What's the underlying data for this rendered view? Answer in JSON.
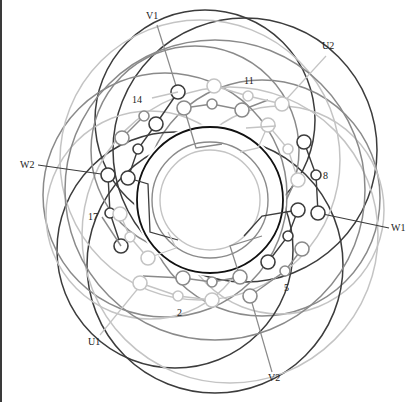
{
  "diagram": {
    "title": "",
    "type": "stator winding diagram (three-phase, 18 slots)",
    "center": [
      210,
      200
    ],
    "colors": {
      "phase_dark": "#3c3c3c",
      "phase_mid": "#8a8a8a",
      "phase_light": "#c4c4c4",
      "core": "#111111",
      "label": "#222222"
    },
    "terminal_labels": [
      {
        "text": "V1",
        "x": 146,
        "y": 19
      },
      {
        "text": "U2",
        "x": 322,
        "y": 49
      },
      {
        "text": "W2",
        "x": 20,
        "y": 168
      },
      {
        "text": "W1",
        "x": 391,
        "y": 231
      },
      {
        "text": "U1",
        "x": 88,
        "y": 345
      },
      {
        "text": "V2",
        "x": 268,
        "y": 381
      }
    ],
    "slot_labels": [
      {
        "text": "14",
        "x": 132,
        "y": 103
      },
      {
        "text": "11",
        "x": 244,
        "y": 84
      },
      {
        "text": "8",
        "x": 323,
        "y": 179
      },
      {
        "text": "17",
        "x": 88,
        "y": 220
      },
      {
        "text": "5",
        "x": 284,
        "y": 291
      },
      {
        "text": "2",
        "x": 177,
        "y": 316
      }
    ],
    "leaders": [
      {
        "from": [
          157,
          25
        ],
        "to": [
          178,
          92
        ],
        "color": "mid"
      },
      {
        "from": [
          326,
          56
        ],
        "to": [
          282,
          104
        ],
        "color": "light"
      },
      {
        "from": [
          38,
          165
        ],
        "to": [
          108,
          175
        ],
        "color": "dark"
      },
      {
        "from": [
          389,
          228
        ],
        "to": [
          318,
          213
        ],
        "color": "dark"
      },
      {
        "from": [
          100,
          335
        ],
        "to": [
          140,
          286
        ],
        "color": "light"
      },
      {
        "from": [
          272,
          372
        ],
        "to": [
          250,
          296
        ],
        "color": "mid"
      }
    ],
    "outer_arcs": [
      {
        "cx": 245,
        "cy": 150,
        "r": 132,
        "color": "dark"
      },
      {
        "cx": 205,
        "cy": 120,
        "r": 110,
        "color": "dark"
      },
      {
        "cx": 262,
        "cy": 198,
        "r": 118,
        "color": "mid"
      },
      {
        "cx": 280,
        "cy": 210,
        "r": 104,
        "color": "light"
      },
      {
        "cx": 175,
        "cy": 250,
        "r": 118,
        "color": "dark"
      },
      {
        "cx": 215,
        "cy": 265,
        "r": 128,
        "color": "dark"
      },
      {
        "cx": 165,
        "cy": 195,
        "r": 122,
        "color": "mid"
      },
      {
        "cx": 200,
        "cy": 160,
        "r": 140,
        "color": "light"
      },
      {
        "cx": 150,
        "cy": 215,
        "r": 104,
        "color": "light"
      },
      {
        "cx": 230,
        "cy": 235,
        "r": 148,
        "color": "light"
      },
      {
        "cx": 215,
        "cy": 190,
        "r": 150,
        "color": "mid"
      },
      {
        "cx": 195,
        "cy": 150,
        "r": 104,
        "color": "mid"
      }
    ],
    "inner_rings": [
      {
        "r": 73,
        "color": "core",
        "width": 1.8
      },
      {
        "r": 58,
        "color": "mid",
        "width": 1.4
      },
      {
        "r": 50,
        "color": "light",
        "width": 1.4
      }
    ],
    "chains": [
      {
        "color": "dark",
        "points": [
          [
            178,
            92
          ],
          [
            156,
            124
          ],
          [
            138,
            149
          ],
          [
            128,
            178
          ]
        ],
        "sizes": [
          7,
          7,
          5,
          7
        ]
      },
      {
        "color": "dark",
        "points": [
          [
            108,
            175
          ],
          [
            110,
            213
          ],
          [
            121,
            246
          ]
        ],
        "sizes": [
          7,
          5,
          7
        ]
      },
      {
        "color": "dark",
        "points": [
          [
            304,
            142
          ],
          [
            316,
            175
          ],
          [
            318,
            213
          ]
        ],
        "sizes": [
          7,
          5,
          7
        ]
      },
      {
        "color": "dark",
        "points": [
          [
            298,
            210
          ],
          [
            288,
            236
          ],
          [
            268,
            262
          ]
        ],
        "sizes": [
          7,
          5,
          7
        ]
      },
      {
        "color": "mid",
        "points": [
          [
            184,
            108
          ],
          [
            212,
            104
          ],
          [
            242,
            110
          ],
          [
            268,
            100
          ]
        ],
        "sizes": [
          7,
          5,
          7,
          0
        ]
      },
      {
        "color": "mid",
        "points": [
          [
            124,
            192
          ]
        ],
        "sizes": [
          0
        ]
      },
      {
        "color": "mid",
        "points": [
          [
            102,
            217
          ],
          [
            121,
            246
          ]
        ],
        "sizes": [
          0,
          0
        ]
      },
      {
        "color": "mid",
        "points": [
          [
            143,
            276
          ],
          [
            183,
            278
          ],
          [
            212,
            282
          ],
          [
            240,
            277
          ]
        ],
        "sizes": [
          0,
          7,
          5,
          7
        ]
      },
      {
        "color": "mid",
        "points": [
          [
            122,
            138
          ],
          [
            144,
            116
          ]
        ],
        "sizes": [
          7,
          5
        ]
      },
      {
        "color": "mid",
        "points": [
          [
            302,
            249
          ],
          [
            285,
            271
          ],
          [
            250,
            296
          ]
        ],
        "sizes": [
          7,
          5,
          7
        ]
      },
      {
        "color": "light",
        "points": [
          [
            152,
            98
          ],
          [
            178,
            92
          ]
        ],
        "sizes": [
          0,
          0
        ]
      },
      {
        "color": "light",
        "points": [
          [
            214,
            86
          ],
          [
            248,
            96
          ],
          [
            282,
            104
          ]
        ],
        "sizes": [
          7,
          5,
          7
        ]
      },
      {
        "color": "light",
        "points": [
          [
            268,
            125
          ],
          [
            288,
            149
          ],
          [
            298,
            180
          ]
        ],
        "sizes": [
          7,
          5,
          7
        ]
      },
      {
        "color": "light",
        "points": [
          [
            120,
            214
          ],
          [
            130,
            237
          ],
          [
            148,
            258
          ]
        ],
        "sizes": [
          7,
          5,
          7
        ]
      },
      {
        "color": "light",
        "points": [
          [
            140,
            283
          ],
          [
            178,
            296
          ],
          [
            212,
            300
          ]
        ],
        "sizes": [
          7,
          5,
          7
        ]
      },
      {
        "color": "light",
        "points": [
          [
            276,
            126
          ],
          [
            246,
            128
          ]
        ],
        "sizes": [
          0,
          0
        ]
      }
    ],
    "lead_in_paths": [
      {
        "color": "mid",
        "d": "M 184 108 L 196 148 L 222 144"
      },
      {
        "color": "dark",
        "d": "M 128 178 L 148 184 L 150 232 L 178 240"
      },
      {
        "color": "dark",
        "d": "M 298 210 L 262 216 L 244 236"
      },
      {
        "color": "mid",
        "d": "M 240 277 L 230 246 L 262 236"
      },
      {
        "color": "light",
        "d": "M 268 125 L 258 148 L 240 152"
      },
      {
        "color": "light",
        "d": "M 148 258 L 176 248 L 168 232"
      }
    ]
  }
}
